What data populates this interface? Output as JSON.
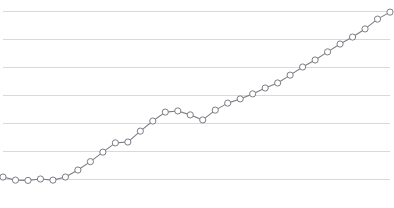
{
  "chart_data": {
    "type": "line",
    "title": "",
    "subtitle": "",
    "xlabel": "",
    "ylabel": "",
    "grid": true,
    "grid_axis": "y",
    "legend": false,
    "legend_position": "none",
    "marker": "circle-open",
    "xlim": [
      0,
      31
    ],
    "ylim": [
      0,
      6
    ],
    "yticks": [
      0,
      1,
      2,
      3,
      4,
      5,
      6
    ],
    "ytick_labels": [
      "",
      "",
      "",
      "",
      "",
      "",
      ""
    ],
    "xticks": [],
    "xtick_labels": [],
    "x": [
      0,
      1,
      2,
      3,
      4,
      5,
      6,
      7,
      8,
      9,
      10,
      11,
      12,
      13,
      14,
      15,
      16,
      17,
      18,
      19,
      20,
      21,
      22,
      23,
      24,
      25,
      26,
      27,
      28,
      29,
      30,
      31
    ],
    "series": [
      {
        "name": "series-1",
        "color": "#7d7d85",
        "marker_fill": "#ffffff",
        "marker_edge": "#7d7d85",
        "values": [
          0.07,
          -0.04,
          -0.05,
          0.0,
          -0.04,
          0.07,
          0.32,
          0.62,
          0.96,
          1.29,
          1.32,
          1.71,
          2.07,
          2.39,
          2.43,
          2.29,
          2.11,
          2.46,
          2.71,
          2.86,
          3.04,
          3.25,
          3.43,
          3.71,
          4.0,
          4.25,
          4.54,
          4.82,
          5.07,
          5.36,
          5.71,
          5.96
        ]
      }
    ]
  },
  "style": {
    "background_color": "#ffffff",
    "grid_color": "#d9d9d9",
    "line_color": "#7d7d85",
    "marker_fill_color": "#ffffff",
    "marker_edge_color": "#7d7d85",
    "line_width": 1.1,
    "marker_radius": 3.1,
    "marker_edge_width": 1.0
  },
  "plot_area": {
    "left": 3,
    "right": 390,
    "top": 11,
    "bottom": 179
  }
}
